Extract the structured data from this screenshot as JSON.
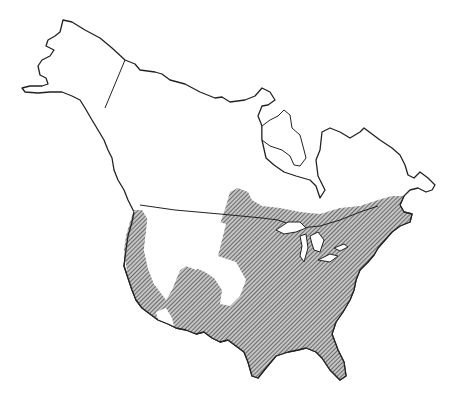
{
  "map": {
    "type": "range-map",
    "region": "North America",
    "regions_shown": [
      "Alaska",
      "Canada",
      "United States",
      "Mexico (northern edge)"
    ],
    "range_style": "diagonal-hatch",
    "colors": {
      "outline": "#222222",
      "hatch": "#555555",
      "hatch_bg": "#bdbdbd",
      "background": "#ffffff"
    },
    "range_description": "Hatched range covering most of the eastern and central United States, southern Canada near the Great Lakes and Maritimes, and the Pacific coast, with unhatched interior western areas"
  }
}
